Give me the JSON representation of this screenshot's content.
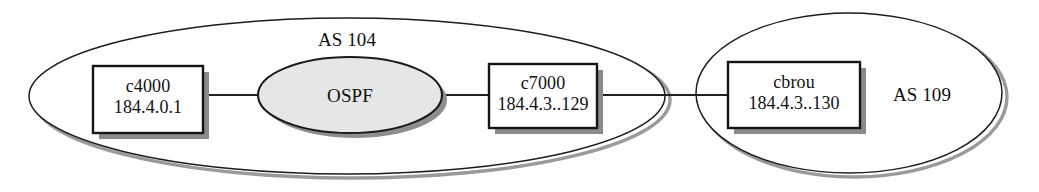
{
  "diagram": {
    "type": "network-topology",
    "background_color": "#ffffff",
    "autonomous_systems": [
      {
        "id": "as-104",
        "label": "AS 104",
        "label_position": "top-center",
        "shape": "ellipse",
        "fill_color": "#ffffff",
        "border_color": "#1d1d1d"
      },
      {
        "id": "as-109",
        "label": "AS 109",
        "label_position": "right-center",
        "shape": "ellipse",
        "fill_color": "#ffffff",
        "border_color": "#1d1d1d"
      }
    ],
    "protocol_cloud": {
      "id": "ospf-cloud",
      "label": "OSPF",
      "shape": "ellipse",
      "fill_color": "#e6e6e6",
      "border_color": "#1a1a1a",
      "inside_of": "AS 104"
    },
    "nodes": [
      {
        "id": "c4000",
        "name": "c4000",
        "address": "184.4.0.1",
        "shape": "rectangle",
        "fill_color": "#ffffff",
        "border_color": "#141414",
        "inside_of": "AS 104"
      },
      {
        "id": "c7000",
        "name": "c7000",
        "address": "184.4.3..129",
        "shape": "rectangle",
        "fill_color": "#ffffff",
        "border_color": "#141414",
        "inside_of": "AS 104"
      },
      {
        "id": "cbrou",
        "name": "cbrou",
        "address": "184.4.3..130",
        "shape": "rectangle",
        "fill_color": "#ffffff",
        "border_color": "#141414",
        "inside_of": "AS 109"
      }
    ],
    "links": [
      {
        "id": "link-c4000-ospf",
        "from": "c4000",
        "to": "OSPF"
      },
      {
        "id": "link-ospf-c7000",
        "from": "OSPF",
        "to": "c7000"
      },
      {
        "id": "link-c7000-cbrou",
        "from": "c7000",
        "to": "cbrou"
      }
    ]
  }
}
